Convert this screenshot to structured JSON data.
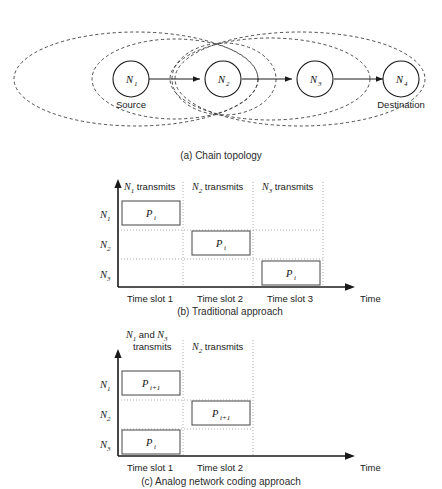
{
  "figure": {
    "panels": [
      {
        "id": "a",
        "caption": "(a) Chain topology",
        "nodes": [
          {
            "label": "N",
            "sub": "1",
            "role": "Source"
          },
          {
            "label": "N",
            "sub": "2",
            "role": ""
          },
          {
            "label": "N",
            "sub": "3",
            "role": ""
          },
          {
            "label": "N",
            "sub": "4",
            "role": "Destination"
          }
        ],
        "range_note": "dashed-ellipse-transmission-range"
      },
      {
        "id": "b",
        "caption": "(b) Traditional approach",
        "y_axis_labels": [
          {
            "label": "N",
            "sub": "1"
          },
          {
            "label": "N",
            "sub": "2"
          },
          {
            "label": "N",
            "sub": "3"
          }
        ],
        "x_axis_label": "Time",
        "slot_labels": [
          "Time slot 1",
          "Time slot 2",
          "Time slot 3"
        ],
        "column_headers": [
          {
            "node": "N",
            "sub": "1",
            "text": " transmits"
          },
          {
            "node": "N",
            "sub": "2",
            "text": " transmits"
          },
          {
            "node": "N",
            "sub": "3",
            "text": " transmits"
          }
        ],
        "packets": [
          {
            "row": "N1",
            "slot": 1,
            "label": "P",
            "sub": "i"
          },
          {
            "row": "N2",
            "slot": 2,
            "label": "P",
            "sub": "i"
          },
          {
            "row": "N3",
            "slot": 3,
            "label": "P",
            "sub": "i"
          }
        ]
      },
      {
        "id": "c",
        "caption": "(c) Analog network coding approach",
        "y_axis_labels": [
          {
            "label": "N",
            "sub": "1"
          },
          {
            "label": "N",
            "sub": "2"
          },
          {
            "label": "N",
            "sub": "3"
          }
        ],
        "x_axis_label": "Time",
        "slot_labels": [
          "Time slot 1",
          "Time slot 2"
        ],
        "column_headers": [
          {
            "line1_a": "N",
            "line1_a_sub": "1",
            "line1_mid": " and ",
            "line1_b": "N",
            "line1_b_sub": "3",
            "line2": "transmits"
          },
          {
            "node": "N",
            "sub": "2",
            "text": " transmits"
          }
        ],
        "packets": [
          {
            "row": "N1",
            "slot": 1,
            "label": "P",
            "sub": "i+1"
          },
          {
            "row": "N2",
            "slot": 2,
            "label": "P",
            "sub": "i+1"
          },
          {
            "row": "N3",
            "slot": 1,
            "label": "P",
            "sub": "i"
          }
        ]
      }
    ],
    "colors": {
      "ink": "#1a1a1a",
      "grid": "#9a9a9a",
      "box_stroke": "#555555",
      "background": "#ffffff"
    }
  }
}
